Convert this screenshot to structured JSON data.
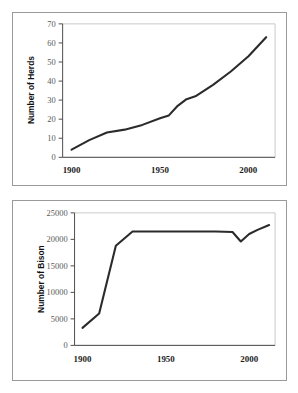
{
  "page": {
    "background_color": "#ffffff",
    "panel_border_color": "#9a9a9a",
    "line_color": "#2b2b2b",
    "axis_color": "#4d4d4d"
  },
  "chart_data": [
    {
      "id": "herds",
      "type": "line",
      "title": "",
      "xlabel": "",
      "ylabel": "Number of Herds",
      "xlim": [
        1895,
        2015
      ],
      "ylim": [
        0,
        70
      ],
      "grid": false,
      "legend": "none",
      "xticks": [
        1900,
        1950,
        2000
      ],
      "xtick_labels": [
        "1900",
        "1950",
        "2000"
      ],
      "yticks": [
        0,
        10,
        20,
        30,
        40,
        50,
        60,
        70
      ],
      "ytick_labels": [
        "0",
        "10",
        "20",
        "30",
        "40",
        "50",
        "60",
        "70"
      ],
      "x": [
        1900,
        1910,
        1920,
        1930,
        1940,
        1950,
        1955,
        1960,
        1965,
        1970,
        1980,
        1990,
        2000,
        2010
      ],
      "values": [
        4,
        9,
        13,
        14.5,
        17,
        20.5,
        22,
        27,
        30.5,
        32,
        38,
        45,
        53,
        63
      ]
    },
    {
      "id": "bison",
      "type": "line",
      "title": "",
      "xlabel": "",
      "ylabel": "Number of Bison",
      "xlim": [
        1895,
        2015
      ],
      "ylim": [
        0,
        25000
      ],
      "grid": false,
      "legend": "none",
      "xticks": [
        1900,
        1950,
        2000
      ],
      "xtick_labels": [
        "1900",
        "1950",
        "2000"
      ],
      "yticks": [
        0,
        5000,
        10000,
        15000,
        20000,
        25000
      ],
      "ytick_labels": [
        "0",
        "5000",
        "10000",
        "15000",
        "20000",
        "25000"
      ],
      "x": [
        1900,
        1910,
        1920,
        1930,
        1950,
        1980,
        1990,
        1995,
        2000,
        2005,
        2012
      ],
      "values": [
        3300,
        6000,
        18800,
        21500,
        21500,
        21500,
        21400,
        19600,
        21000,
        21800,
        22700
      ]
    }
  ]
}
